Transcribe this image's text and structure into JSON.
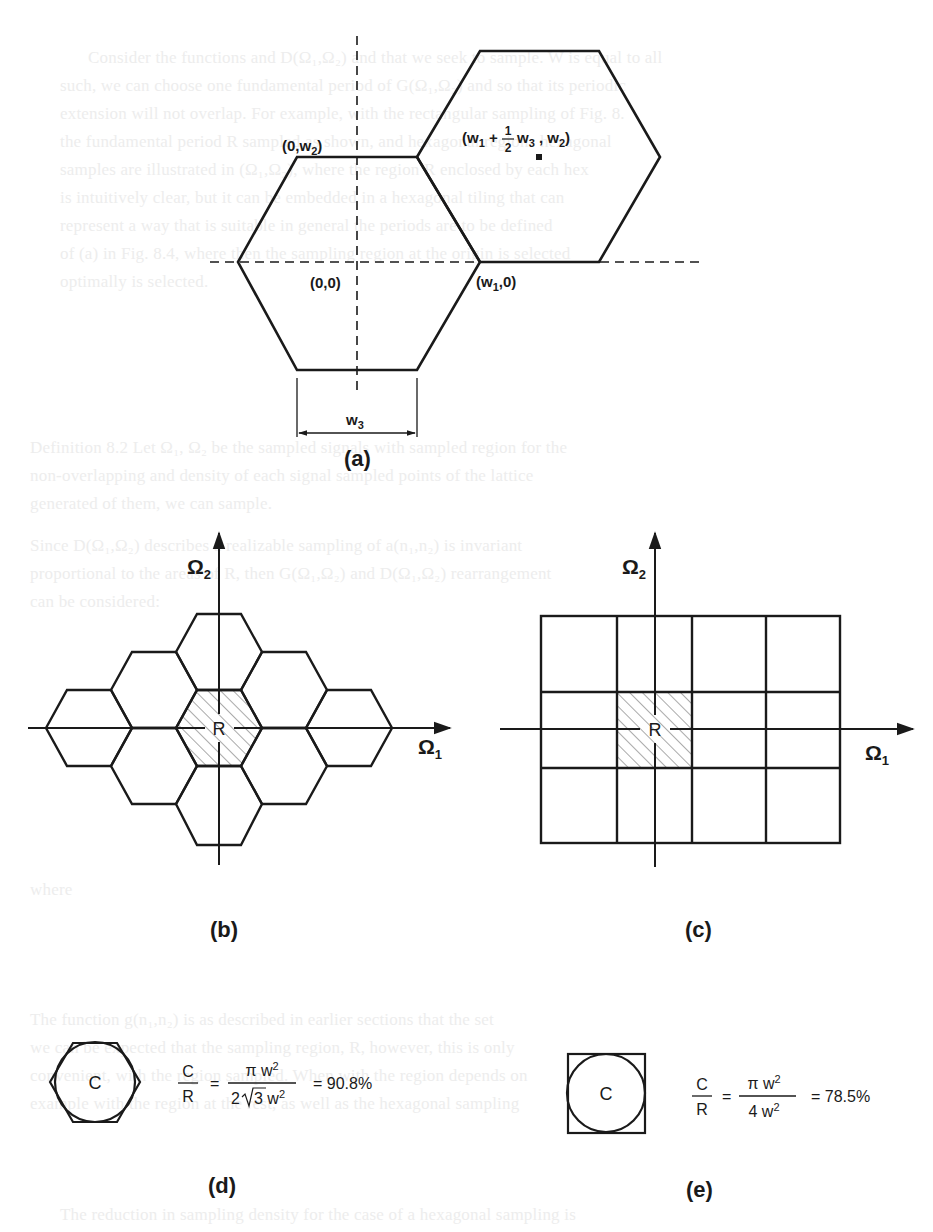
{
  "figure": {
    "panels": {
      "a": {
        "label": "(a)",
        "origin_label": "(0,0)",
        "top_label": "(0,w",
        "top_label_sub": "2",
        "top_label_close": ")",
        "w1_label": "(w",
        "w1_label_sub": "1",
        "w1_label_close": ",0)",
        "center_label_open": "(w",
        "center_label_sub1": "1",
        "center_label_plus": " + ",
        "center_frac_num": "1",
        "center_frac_den": "2",
        "center_label_w3": "w",
        "center_label_sub3": "3",
        "center_label_comma": " , w",
        "center_label_sub2": "2",
        "center_label_close": ")",
        "dim_label": "w",
        "dim_label_sub": "3"
      },
      "b": {
        "label": "(b)",
        "region_label": "R",
        "axis_x": "Ω",
        "axis_x_sub": "1",
        "axis_y": "Ω",
        "axis_y_sub": "2"
      },
      "c": {
        "label": "(c)",
        "region_label": "R",
        "axis_x": "Ω",
        "axis_x_sub": "1",
        "axis_y": "Ω",
        "axis_y_sub": "2"
      },
      "d": {
        "label": "(d)",
        "shape_label": "C",
        "ratio_num": "C",
        "ratio_den": "R",
        "eq": "=",
        "frac_num": "π w",
        "frac_num_sup": "2",
        "frac_den_pre": "2",
        "frac_den_root": "3",
        "frac_den_post": " w",
        "frac_den_sup": "2",
        "result": "= 90.8%"
      },
      "e": {
        "label": "(e)",
        "shape_label": "C",
        "ratio_num": "C",
        "ratio_den": "R",
        "eq": "=",
        "frac_num": "π w",
        "frac_num_sup": "2",
        "frac_den": "4 w",
        "frac_den_sup": "2",
        "result": "= 78.5%"
      }
    },
    "colors": {
      "ink": "#1a1a1a",
      "hatch": "#555555",
      "ghost_text": "#ededed"
    }
  },
  "ghost_text": [
    "Consider the functions and D(Ω₁,Ω₂) and that we seek to sample. W is equal to all",
    "such, we can choose one fundamental period of G(Ω₁,Ω₂) and so that its periodic",
    "extension will not overlap. For example, with the rectangular sampling of Fig. 8.",
    "the fundamental period R sampled as shown, and hexagonal regions hexagonal",
    "samples are illustrated in (Ω₁,Ω₂), where the region R enclosed by each hex",
    "is intuitively clear, but it can be embedded in a hexagonal tiling that can",
    "represent a way that is suitable in general the periods are to be defined",
    "of (a) in Fig. 8.4, where then the sampling region at the origin is selected",
    "optimally is selected.",
    "Definition 8.2   Let Ω₁, Ω₂ be the sampled signals with sampled region for the",
    "non-overlapping and density of each signal sampled points of the lattice",
    "generated of them, we can sample.",
    "Since D(Ω₁,Ω₂) describes a realizable sampling of a(n₁,n₂) is invariant",
    "proportional to the areas of R, then G(Ω₁,Ω₂) and D(Ω₁,Ω₂) rearrangement",
    "can be considered:",
    "where",
    "The function g(n₁,n₂) is as described in earlier sections that the set",
    "we can be expected that the sampling region, R, however, this is only",
    "convenient, with the region sampled. When with the region depends on",
    "example with the region at the rest, as well as the hexagonal sampling",
    "The reduction in sampling density for the case of a hexagonal sampling is"
  ]
}
